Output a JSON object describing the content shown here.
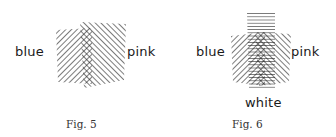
{
  "figures": [
    {
      "id": "fig5",
      "caption": "Fig. 5",
      "labels": {
        "left": "blue",
        "right": "pink"
      },
      "description": "Two overlapping hatched regions: blue (lines sloping down-right) and pink (lines sloping up-right), with a cross-hatched overlap strip in the middle."
    },
    {
      "id": "fig6",
      "caption": "Fig. 6",
      "labels": {
        "left": "blue",
        "right": "pink",
        "bottom": "white"
      },
      "description": "Three overlapping hatched regions: blue (down-right diagonals), pink (up-right diagonals), and white (horizontal lines), with dense cross-hatching in the overlap."
    }
  ],
  "colors": {
    "ink": "#1a1a1a",
    "caption": "#333333",
    "background": "#ffffff"
  }
}
